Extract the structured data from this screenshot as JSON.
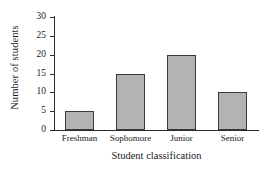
{
  "chart_data": {
    "type": "bar",
    "title": "",
    "subtitle": "",
    "xlabel": "Student classification",
    "ylabel": "Number of students",
    "categories": [
      "Freshman",
      "Sophomore",
      "Junior",
      "Senior"
    ],
    "values": [
      5,
      15,
      20,
      10
    ],
    "series": [
      {
        "name": "Number of students",
        "values": [
          5,
          15,
          20,
          10
        ]
      }
    ],
    "ylim": [
      0,
      30
    ],
    "ytick_labels": [
      "0",
      "5",
      "10",
      "15",
      "20",
      "25",
      "30"
    ],
    "ytick_values": [
      0,
      5,
      10,
      15,
      20,
      25,
      30
    ],
    "ytick_interval": 5,
    "grid": false,
    "legend": false,
    "legend_position": "none",
    "annotations": [],
    "colors": {
      "bar_fill": "#b3b3b3",
      "bar_edge": "#3a3a3a",
      "axis": "#2a2a2a",
      "text": "#1a1a1a",
      "background": "#ffffff"
    }
  }
}
